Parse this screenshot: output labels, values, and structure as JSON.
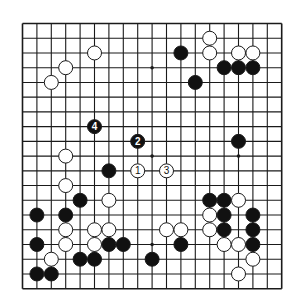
{
  "diagram": {
    "type": "go-board",
    "size": 19,
    "colors": {
      "background": "#ffffff",
      "line": "#1a1a1a",
      "black_stone": "#111111",
      "white_stone": "#ffffff",
      "black_label": "#ffffff",
      "white_label": "#111111"
    },
    "star_points": [
      [
        3,
        3
      ],
      [
        9,
        3
      ],
      [
        15,
        3
      ],
      [
        3,
        9
      ],
      [
        9,
        9
      ],
      [
        15,
        9
      ],
      [
        3,
        15
      ],
      [
        9,
        15
      ],
      [
        15,
        15
      ]
    ],
    "stones": [
      {
        "color": "white",
        "col": 5,
        "row": 2
      },
      {
        "color": "white",
        "col": 3,
        "row": 3
      },
      {
        "color": "white",
        "col": 2,
        "row": 4
      },
      {
        "color": "white",
        "col": 13,
        "row": 1
      },
      {
        "color": "white",
        "col": 13,
        "row": 2
      },
      {
        "color": "black",
        "col": 11,
        "row": 2
      },
      {
        "color": "white",
        "col": 15,
        "row": 2
      },
      {
        "color": "white",
        "col": 16,
        "row": 2
      },
      {
        "color": "black",
        "col": 14,
        "row": 3
      },
      {
        "color": "black",
        "col": 15,
        "row": 3
      },
      {
        "color": "black",
        "col": 16,
        "row": 3
      },
      {
        "color": "black",
        "col": 12,
        "row": 4
      },
      {
        "color": "black",
        "col": 5,
        "row": 7,
        "label": "4"
      },
      {
        "color": "black",
        "col": 8,
        "row": 8,
        "label": "2"
      },
      {
        "color": "black",
        "col": 15,
        "row": 8
      },
      {
        "color": "white",
        "col": 3,
        "row": 9
      },
      {
        "color": "black",
        "col": 6,
        "row": 10
      },
      {
        "color": "white",
        "col": 8,
        "row": 10,
        "label": "1"
      },
      {
        "color": "white",
        "col": 10,
        "row": 10,
        "label": "3"
      },
      {
        "color": "white",
        "col": 3,
        "row": 11
      },
      {
        "color": "black",
        "col": 4,
        "row": 12
      },
      {
        "color": "white",
        "col": 6,
        "row": 12
      },
      {
        "color": "black",
        "col": 13,
        "row": 12
      },
      {
        "color": "black",
        "col": 14,
        "row": 12
      },
      {
        "color": "white",
        "col": 15,
        "row": 12
      },
      {
        "color": "black",
        "col": 1,
        "row": 13
      },
      {
        "color": "black",
        "col": 3,
        "row": 13
      },
      {
        "color": "white",
        "col": 13,
        "row": 13
      },
      {
        "color": "black",
        "col": 14,
        "row": 13
      },
      {
        "color": "black",
        "col": 16,
        "row": 13
      },
      {
        "color": "white",
        "col": 3,
        "row": 14
      },
      {
        "color": "white",
        "col": 5,
        "row": 14
      },
      {
        "color": "white",
        "col": 6,
        "row": 14
      },
      {
        "color": "white",
        "col": 10,
        "row": 14
      },
      {
        "color": "white",
        "col": 11,
        "row": 14
      },
      {
        "color": "white",
        "col": 13,
        "row": 14
      },
      {
        "color": "black",
        "col": 14,
        "row": 14
      },
      {
        "color": "black",
        "col": 16,
        "row": 14
      },
      {
        "color": "black",
        "col": 1,
        "row": 15
      },
      {
        "color": "white",
        "col": 3,
        "row": 15
      },
      {
        "color": "white",
        "col": 5,
        "row": 15
      },
      {
        "color": "black",
        "col": 6,
        "row": 15
      },
      {
        "color": "black",
        "col": 7,
        "row": 15
      },
      {
        "color": "black",
        "col": 11,
        "row": 15
      },
      {
        "color": "white",
        "col": 14,
        "row": 15
      },
      {
        "color": "white",
        "col": 15,
        "row": 15
      },
      {
        "color": "black",
        "col": 16,
        "row": 15
      },
      {
        "color": "white",
        "col": 2,
        "row": 16
      },
      {
        "color": "black",
        "col": 4,
        "row": 16
      },
      {
        "color": "black",
        "col": 5,
        "row": 16
      },
      {
        "color": "black",
        "col": 9,
        "row": 16
      },
      {
        "color": "white",
        "col": 16,
        "row": 16
      },
      {
        "color": "black",
        "col": 1,
        "row": 17
      },
      {
        "color": "black",
        "col": 2,
        "row": 17
      },
      {
        "color": "white",
        "col": 15,
        "row": 17
      }
    ]
  }
}
